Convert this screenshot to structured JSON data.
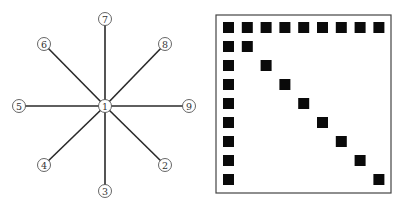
{
  "star_graph": {
    "center": {
      "id": "1",
      "x": 105,
      "y": 106
    },
    "leaves": [
      {
        "id": "2",
        "x": 165,
        "y": 165
      },
      {
        "id": "3",
        "x": 105,
        "y": 191
      },
      {
        "id": "4",
        "x": 44,
        "y": 165
      },
      {
        "id": "5",
        "x": 19,
        "y": 106
      },
      {
        "id": "6",
        "x": 44,
        "y": 44
      },
      {
        "id": "7",
        "x": 105,
        "y": 19
      },
      {
        "id": "8",
        "x": 165,
        "y": 44
      },
      {
        "id": "9",
        "x": 189,
        "y": 106
      }
    ],
    "node_radius": 6.5,
    "edge_color": "#2a2a2a",
    "node_stroke": "#555555"
  },
  "sparsity_matrix": {
    "size": 9,
    "frame": {
      "x": 216,
      "y": 15,
      "width": 175,
      "height": 178
    },
    "origin": {
      "x": 223,
      "y": 22
    },
    "pitch_x": 18.8,
    "pitch_y": 19.0,
    "cell_size": 11,
    "fill_color": "#0a0a0a",
    "description": "Arrowhead pattern: full first row, full first column, and main diagonal nonzeros"
  }
}
